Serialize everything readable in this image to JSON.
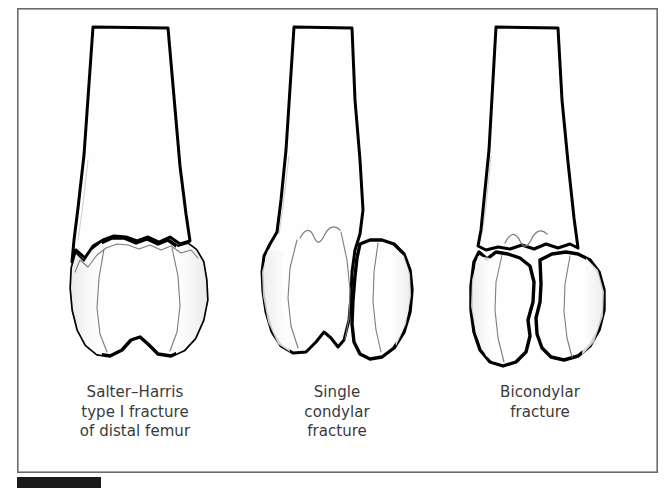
{
  "figure": {
    "kind": "medical-illustration",
    "background_color": "#ffffff",
    "frame": {
      "border_color": "#6b6b6b",
      "x": 17,
      "y": 8,
      "width": 641,
      "height": 465
    },
    "page_marker": {
      "color": "#1b1b1b",
      "x": 17,
      "y": 477,
      "width": 84,
      "height": 11
    },
    "line_color": "#000000",
    "inner_line_color": "#7c7c7c",
    "text_color": "#3a3a3a"
  },
  "panels": [
    {
      "id": "salter-harris-type-1",
      "center_x": 135,
      "caption_lines": [
        "Salter–Harris",
        "type I fracture",
        "of distal femur"
      ],
      "caption_top": 383,
      "fracture_type": "Salter-Harris type I physeal separation",
      "description": "Transverse wavy separation through the physis of the distal femur with the epiphysis displaced as a single fragment"
    },
    {
      "id": "single-condylar",
      "center_x": 337,
      "caption_lines": [
        "Single",
        "condylar",
        "fracture"
      ],
      "caption_top": 383,
      "fracture_type": "Single condylar fracture",
      "description": "Oblique fracture line splitting one femoral condyle which is displaced laterally and distally"
    },
    {
      "id": "bicondylar",
      "center_x": 540,
      "caption_lines": [
        "Bicondylar",
        "fracture"
      ],
      "caption_top": 383,
      "fracture_type": "Bicondylar (T/Y-shaped) fracture",
      "description": "Transverse supracondylar fracture combined with a vertical intercondylar split separating both condyles"
    }
  ]
}
